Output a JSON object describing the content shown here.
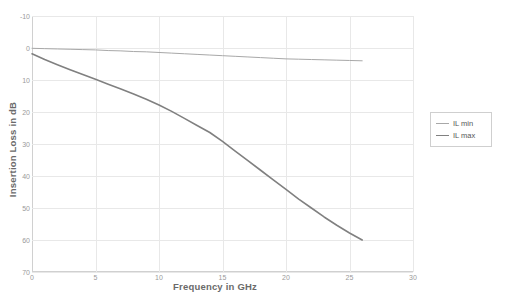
{
  "chart_data": {
    "type": "line",
    "title": "",
    "xlabel": "Frequency in GHz",
    "ylabel": "Insertion Loss in dB",
    "xlim": [
      0,
      30
    ],
    "ylim": [
      -10,
      70
    ],
    "y_inverted": true,
    "grid": true,
    "legend_position": "right",
    "xticks": [
      "0",
      "5",
      "10",
      "15",
      "20",
      "25",
      "30"
    ],
    "yticks": [
      "-10",
      "0",
      "10",
      "20",
      "30",
      "40",
      "50",
      "60",
      "70"
    ],
    "series": [
      {
        "name": "IL min",
        "color": "#a8a8a8",
        "x": [
          0,
          1,
          2,
          3,
          4,
          5,
          6,
          7,
          8,
          9,
          10,
          11,
          12,
          13,
          14,
          15,
          16,
          17,
          18,
          19,
          20,
          21,
          22,
          23,
          24,
          25,
          26
        ],
        "values": [
          0.1,
          0.2,
          0.3,
          0.4,
          0.5,
          0.6,
          0.8,
          0.9,
          1.1,
          1.2,
          1.4,
          1.6,
          1.8,
          2.0,
          2.2,
          2.4,
          2.6,
          2.8,
          3.0,
          3.2,
          3.4,
          3.5,
          3.6,
          3.7,
          3.8,
          3.9,
          4.0
        ]
      },
      {
        "name": "IL max",
        "color": "#808080",
        "x": [
          0,
          1,
          2,
          3,
          4,
          5,
          6,
          7,
          8,
          9,
          10,
          11,
          12,
          13,
          14,
          15,
          16,
          17,
          18,
          19,
          20,
          21,
          22,
          23,
          24,
          25,
          26
        ],
        "values": [
          1.8,
          3.6,
          5.2,
          6.8,
          8.3,
          9.8,
          11.3,
          12.8,
          14.4,
          16.0,
          17.8,
          19.8,
          22.0,
          24.2,
          26.4,
          29.2,
          32.2,
          35.2,
          38.2,
          41.2,
          44.2,
          47.2,
          50.0,
          52.8,
          55.4,
          57.8,
          60.0
        ]
      }
    ]
  },
  "legend": {
    "items": [
      {
        "label": "IL min"
      },
      {
        "label": "IL max"
      }
    ]
  }
}
